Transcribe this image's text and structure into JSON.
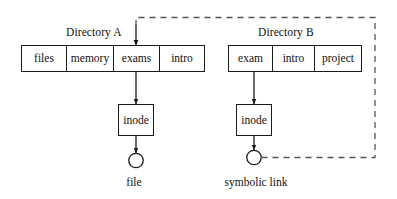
{
  "diagram": {
    "title_a": "Directory A",
    "title_b": "Directory B",
    "directory_a": {
      "label": "Directory A",
      "cells": [
        {
          "name": "files"
        },
        {
          "name": "memory"
        },
        {
          "name": "exams"
        },
        {
          "name": "intro"
        }
      ]
    },
    "directory_b": {
      "label": "Directory B",
      "cells": [
        {
          "name": "exam"
        },
        {
          "name": "intro"
        },
        {
          "name": "project"
        }
      ]
    },
    "inode_a": "inode",
    "inode_b": "inode",
    "endpoint_file_label": "file",
    "endpoint_symlink_label": "symbolic link",
    "colors": {
      "stroke": "#1a1a1a",
      "dashed_stroke": "#555555",
      "background": "#ffffff",
      "text": "#111111"
    }
  }
}
